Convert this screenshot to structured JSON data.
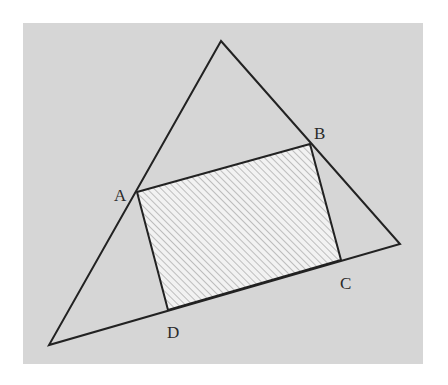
{
  "figure": {
    "panel": {
      "x": 23,
      "y": 23,
      "width": 400,
      "height": 341,
      "color": "#d6d6d6"
    },
    "line_color": "#222222",
    "hatch_fill": "#f2f2f2",
    "hatch_line": "#bdbdbd",
    "outer_triangle": {
      "vertices": [
        {
          "name": "apex",
          "x": 221,
          "y": 41
        },
        {
          "name": "right",
          "x": 400,
          "y": 244
        },
        {
          "name": "bottom-left",
          "x": 49,
          "y": 345
        }
      ]
    },
    "quadrilateral": {
      "points": [
        {
          "label": "A",
          "x": 137,
          "y": 192,
          "label_x": 114,
          "label_y": 201
        },
        {
          "label": "B",
          "x": 310,
          "y": 144,
          "label_x": 314,
          "label_y": 139
        },
        {
          "label": "C",
          "x": 341,
          "y": 260,
          "label_x": 340,
          "label_y": 289
        },
        {
          "label": "D",
          "x": 168,
          "y": 310,
          "label_x": 167,
          "label_y": 338
        }
      ],
      "shaded": true
    }
  },
  "labels": {
    "A": "A",
    "B": "B",
    "C": "C",
    "D": "D"
  }
}
